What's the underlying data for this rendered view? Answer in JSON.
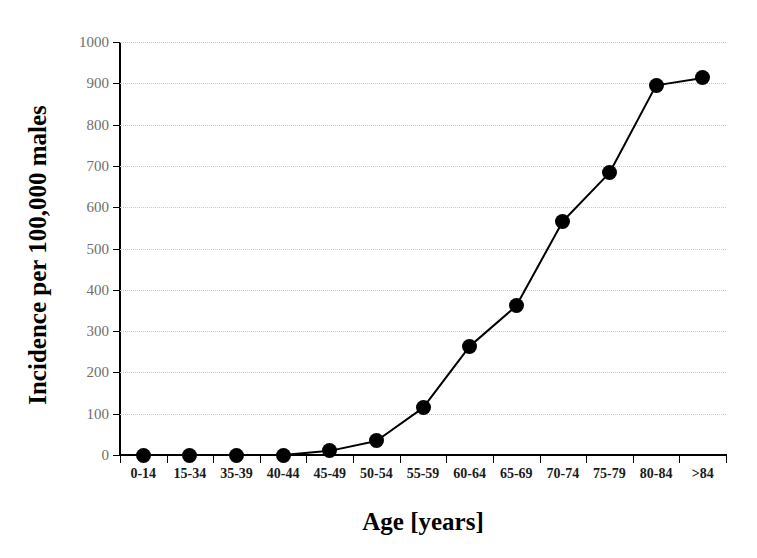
{
  "chart_data": {
    "type": "line",
    "title": "",
    "xlabel": "Age [years]",
    "ylabel": "Incidence per 100,000 males",
    "categories": [
      "0-14",
      "15-34",
      "35-39",
      "40-44",
      "45-49",
      "50-54",
      "55-59",
      "60-64",
      "65-69",
      "70-74",
      "75-79",
      "80-84",
      ">84"
    ],
    "values": [
      0,
      0,
      0,
      0,
      10,
      34,
      114,
      263,
      361,
      566,
      683,
      895,
      913
    ],
    "series": [
      {
        "name": "Incidence",
        "values": [
          0,
          0,
          0,
          0,
          10,
          34,
          114,
          263,
          361,
          566,
          683,
          895,
          913
        ]
      }
    ],
    "ylim": [
      0,
      1000
    ],
    "yticks": [
      0,
      100,
      200,
      300,
      400,
      500,
      600,
      700,
      800,
      900,
      1000
    ],
    "ytick_labels": [
      "0",
      "100",
      "200",
      "300",
      "400",
      "500",
      "600",
      "700",
      "800",
      "900",
      "1000"
    ],
    "grid": true,
    "grid_axis": "y",
    "legend": false,
    "legend_position": "none",
    "marker": "filled-circle",
    "marker_color": "#000000",
    "line_color": "#000000"
  },
  "style": {
    "background": "#ffffff",
    "axis_color": "#000000",
    "grid_color": "#c9c9c9",
    "ytick_label_color": "#6e6e6e",
    "xtick_label_color": "#1a1a1a"
  }
}
